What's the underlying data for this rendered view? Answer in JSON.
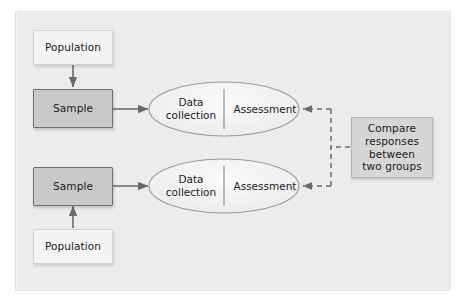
{
  "figure": {
    "type": "flow-diagram",
    "background_color": "#ececec",
    "frame_color": "#e2e2e2"
  },
  "colors": {
    "population_fill": "#f4f4f4",
    "population_border": "#d4d4d4",
    "sample_fill": "#c9c9c9",
    "sample_border": "#6f6f6f",
    "compare_fill": "#d6d6d6",
    "compare_border": "#b4b4b4",
    "ellipse_fill": "#f0f0f0",
    "ellipse_border": "#9a9a9a",
    "arrow_color": "#6a6a6a",
    "text_color": "#1b1b1b"
  },
  "groups": [
    {
      "id": "group-top",
      "population_label": "Population",
      "sample_label": "Sample",
      "process": {
        "left_label": "Data\ncollection",
        "right_label": "Assessment"
      },
      "sampling_arrow_direction": "down"
    },
    {
      "id": "group-bottom",
      "population_label": "Population",
      "sample_label": "Sample",
      "process": {
        "left_label": "Data\ncollection",
        "right_label": "Assessment"
      },
      "sampling_arrow_direction": "up"
    }
  ],
  "comparison": {
    "lines": [
      "Compare",
      "responses",
      "between",
      "two groups"
    ],
    "connector_style": "dashed",
    "connector_arrow_direction": "left"
  }
}
